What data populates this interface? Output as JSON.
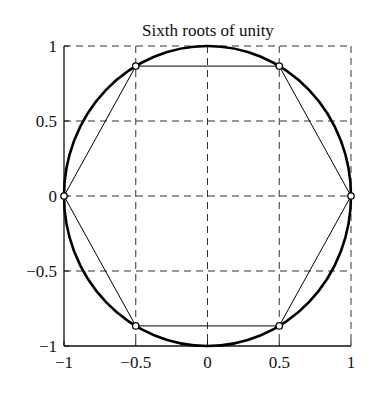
{
  "chart_data": {
    "type": "line",
    "title": "Sixth roots of unity",
    "xlabel": "",
    "ylabel": "",
    "xlim": [
      -1,
      1
    ],
    "ylim": [
      -1,
      1
    ],
    "grid": true,
    "grid_style": "dashed",
    "x_ticks": [
      -1,
      -0.5,
      0,
      0.5,
      1
    ],
    "x_tick_labels": [
      "−1",
      "−0.5",
      "0",
      "0.5",
      "1"
    ],
    "y_ticks": [
      -1,
      -0.5,
      0,
      0.5,
      1
    ],
    "y_tick_labels": [
      "−1",
      "−0.5",
      "0",
      "0.5",
      "1"
    ],
    "series": [
      {
        "name": "unit circle",
        "kind": "curve",
        "equation": "x^2 + y^2 = 1",
        "color": "#000000"
      },
      {
        "name": "hexagon",
        "kind": "polygon-with-markers",
        "marker": "open-circle",
        "color": "#000000",
        "points": [
          {
            "x": 1,
            "y": 0
          },
          {
            "x": 0.5,
            "y": 0.866
          },
          {
            "x": -0.5,
            "y": 0.866
          },
          {
            "x": -1,
            "y": 0
          },
          {
            "x": -0.5,
            "y": -0.866
          },
          {
            "x": 0.5,
            "y": -0.866
          }
        ]
      }
    ]
  }
}
